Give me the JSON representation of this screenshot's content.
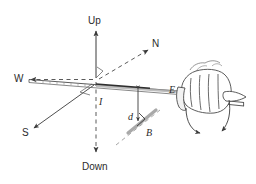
{
  "figure": {
    "type": "physics-diagram",
    "background_color": "#ffffff",
    "ink_color": "#3a3a3a",
    "line_color": "#555555"
  },
  "axes": {
    "up": {
      "label": "Up",
      "style": "solid-arrow",
      "direction": "up"
    },
    "down": {
      "label": "Down",
      "style": "dashed-arrow",
      "direction": "down"
    },
    "north": {
      "label": "N",
      "style": "dashed-arrow",
      "direction": "up-right"
    },
    "south": {
      "label": "S",
      "style": "solid-arrow",
      "direction": "down-left"
    },
    "west": {
      "label": "W",
      "style": "dashed-arrow",
      "direction": "left"
    },
    "east": {
      "label": "E",
      "style": "solid",
      "direction": "right"
    },
    "right_angle_marks": 2
  },
  "annotations": {
    "current": {
      "label": "I",
      "meaning": "current in wire"
    },
    "distance": {
      "label": "d",
      "meaning": "perpendicular distance from wire"
    },
    "field": {
      "label": "B",
      "meaning": "magnetic field vector"
    }
  },
  "objects": {
    "wire": {
      "name": "wire",
      "description": "long straight conductor running W-E"
    },
    "hand": {
      "name": "hand",
      "description": "fist gripping the wire, thumb pointing along current"
    },
    "rotation_arrow": {
      "name": "curl-arrow",
      "description": "curved arrow showing field circulation around wire"
    }
  }
}
